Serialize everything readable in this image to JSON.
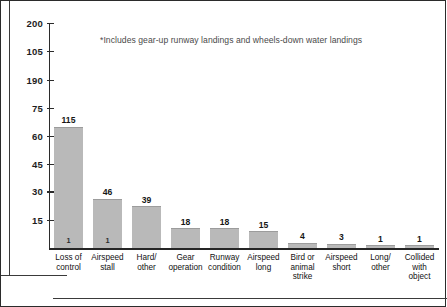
{
  "annotation": {
    "text": "*Includes gear-up runway landings and wheels-down water landings"
  },
  "chart_data": {
    "type": "bar",
    "title": "",
    "subtitle": "",
    "xlabel": "",
    "ylabel": "",
    "grid": false,
    "legend": "none",
    "orientation": "vertical",
    "bar_color": "#b9b9b9",
    "axis_color": "#2b2b2b",
    "ylim": [
      0,
      215
    ],
    "ytick_labels": [
      "200",
      "105",
      "190",
      "75",
      "60",
      "45",
      "30",
      "15"
    ],
    "ytick_positions": [
      215,
      188,
      161,
      134,
      107,
      80,
      54,
      27
    ],
    "categories": [
      "Loss of control",
      "Airspeed stall",
      "Hard/ other",
      "Gear operation",
      "Runway condition",
      "Airspeed long",
      "Bird or animal strike",
      "Airspeed short",
      "Long/ other",
      "Collided with object"
    ],
    "category_lines": [
      [
        "Loss of",
        "control"
      ],
      [
        "Airspeed",
        "stall"
      ],
      [
        "Hard/",
        "other"
      ],
      [
        "Gear",
        "operation"
      ],
      [
        "Runway",
        "condition"
      ],
      [
        "Airspeed",
        "long"
      ],
      [
        "Bird or",
        "animal",
        "strike"
      ],
      [
        "Airspeed",
        "short"
      ],
      [
        "Long/",
        "other"
      ],
      [
        "Collided",
        "with",
        "object"
      ]
    ],
    "values": [
      115,
      46,
      39,
      18,
      18,
      15,
      4,
      3,
      1,
      1
    ],
    "value_labels": [
      "115",
      "46",
      "39",
      "18",
      "18",
      "15",
      "4",
      "3",
      "1",
      "1"
    ],
    "inner_marks": [
      "1",
      "1",
      "",
      "",
      "",
      "",
      "",
      "",
      "",
      ""
    ],
    "annotation": "*Includes gear-up runway landings and wheels-down water landings"
  }
}
